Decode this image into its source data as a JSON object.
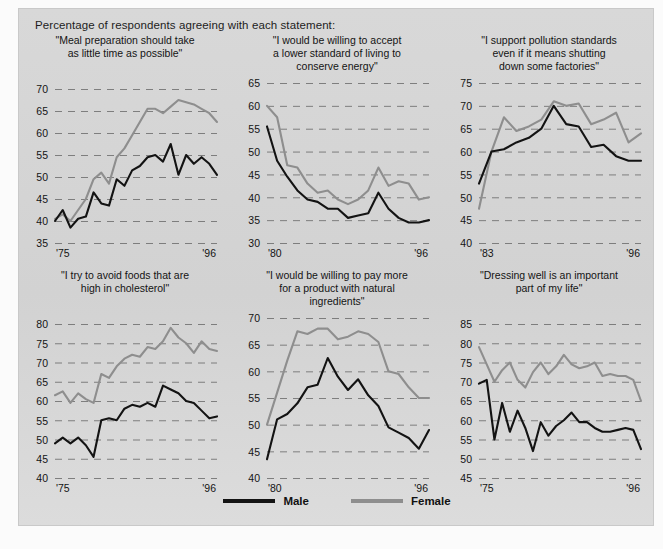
{
  "figure": {
    "header_note": "Percentage of respondents agreeing with each statement:",
    "source_note": "",
    "background_color": "#d6d6d6",
    "male_color": "#131313",
    "female_color": "#8e8e8e"
  },
  "legend": {
    "position": "bottom-center",
    "entries": [
      {
        "label": "Male",
        "color": "#131313",
        "name": "male"
      },
      {
        "label": "Female",
        "color": "#8e8e8e",
        "name": "female"
      }
    ]
  },
  "chart_data": [
    {
      "type": "line",
      "title": "\"Meal preparation should take\nas little time as possible\"",
      "xlabel": "",
      "ylabel": "",
      "ylim": [
        35,
        70
      ],
      "yticks": [
        35,
        40,
        45,
        50,
        55,
        60,
        65,
        70
      ],
      "xlim": [
        1975,
        1996
      ],
      "xticks": [
        "'75",
        "'96"
      ],
      "grid": true,
      "x": [
        1975,
        1976,
        1977,
        1978,
        1979,
        1980,
        1981,
        1982,
        1983,
        1984,
        1985,
        1986,
        1987,
        1988,
        1989,
        1990,
        1991,
        1992,
        1993,
        1994,
        1995,
        1996
      ],
      "series": [
        {
          "name": "Male",
          "color": "#131313",
          "values": [
            40.0,
            42.5,
            38.5,
            40.5,
            41.0,
            46.5,
            44.0,
            43.5,
            49.5,
            48.0,
            51.5,
            52.5,
            54.5,
            55.0,
            53.5,
            57.5,
            50.5,
            55.0,
            53.0,
            54.5,
            53.0,
            50.5
          ]
        },
        {
          "name": "Female",
          "color": "#8e8e8e",
          "values": [
            40.5,
            41.5,
            40.0,
            42.5,
            45.0,
            49.5,
            51.0,
            48.5,
            54.5,
            56.5,
            59.5,
            62.5,
            65.5,
            65.5,
            64.5,
            66.0,
            67.5,
            67.0,
            66.5,
            65.5,
            64.5,
            62.5
          ]
        }
      ]
    },
    {
      "type": "line",
      "title": "\"I would be willing to accept\na lower standard of living to\nconserve energy\"",
      "xlabel": "",
      "ylabel": "",
      "ylim": [
        30,
        65
      ],
      "yticks": [
        30,
        35,
        40,
        45,
        50,
        55,
        60,
        65
      ],
      "xlim": [
        1980,
        1996
      ],
      "xticks": [
        "'80",
        "'96"
      ],
      "grid": true,
      "x": [
        1980,
        1981,
        1982,
        1983,
        1984,
        1985,
        1986,
        1987,
        1988,
        1989,
        1990,
        1991,
        1992,
        1993,
        1994,
        1995,
        1996
      ],
      "series": [
        {
          "name": "Male",
          "color": "#131313",
          "values": [
            55.5,
            48.0,
            44.5,
            41.5,
            39.5,
            39.0,
            37.5,
            37.5,
            35.5,
            36.0,
            36.5,
            41.0,
            37.5,
            35.5,
            34.5,
            34.5,
            35.0
          ]
        },
        {
          "name": "Female",
          "color": "#8e8e8e",
          "values": [
            60.0,
            57.5,
            47.0,
            46.5,
            43.0,
            41.0,
            41.5,
            39.5,
            38.5,
            39.5,
            41.5,
            46.5,
            42.5,
            43.5,
            43.0,
            39.5,
            40.0
          ]
        }
      ]
    },
    {
      "type": "line",
      "title": "\"I support pollution standards\neven if it means shutting\ndown some factories\"",
      "xlabel": "",
      "ylabel": "",
      "ylim": [
        40,
        75
      ],
      "yticks": [
        40,
        45,
        50,
        55,
        60,
        65,
        70,
        75
      ],
      "xlim": [
        1983,
        1996
      ],
      "xticks": [
        "'83",
        "'96"
      ],
      "grid": true,
      "x": [
        1983,
        1984,
        1985,
        1986,
        1987,
        1988,
        1989,
        1990,
        1991,
        1992,
        1993,
        1994,
        1995,
        1996
      ],
      "series": [
        {
          "name": "Male",
          "color": "#131313",
          "values": [
            53.0,
            60.0,
            60.5,
            62.0,
            63.0,
            65.0,
            70.0,
            66.0,
            65.5,
            61.0,
            61.5,
            59.0,
            58.0,
            58.0
          ]
        },
        {
          "name": "Female",
          "color": "#8e8e8e",
          "values": [
            47.5,
            60.0,
            67.5,
            64.5,
            65.5,
            67.0,
            71.0,
            70.0,
            70.5,
            66.0,
            67.0,
            68.5,
            62.0,
            64.0
          ]
        }
      ]
    },
    {
      "type": "line",
      "title": "\"I try to avoid foods that are\nhigh in cholesterol\"",
      "xlabel": "",
      "ylabel": "",
      "ylim": [
        40,
        80
      ],
      "yticks": [
        40,
        45,
        50,
        55,
        60,
        65,
        70,
        75,
        80
      ],
      "xlim": [
        1975,
        1996
      ],
      "xticks": [
        "'75",
        "'96"
      ],
      "grid": true,
      "x": [
        1975,
        1976,
        1977,
        1978,
        1979,
        1980,
        1981,
        1982,
        1983,
        1984,
        1985,
        1986,
        1987,
        1988,
        1989,
        1990,
        1991,
        1992,
        1993,
        1994,
        1995,
        1996
      ],
      "series": [
        {
          "name": "Male",
          "color": "#131313",
          "values": [
            49.0,
            50.5,
            49.0,
            50.5,
            48.5,
            45.5,
            55.0,
            55.5,
            55.0,
            58.0,
            59.0,
            58.5,
            59.5,
            58.5,
            64.0,
            63.0,
            62.0,
            60.0,
            59.5,
            57.5,
            55.5,
            56.0
          ]
        },
        {
          "name": "Female",
          "color": "#8e8e8e",
          "values": [
            61.5,
            62.5,
            59.5,
            62.0,
            60.5,
            59.5,
            67.0,
            66.0,
            69.0,
            71.0,
            72.0,
            71.5,
            74.0,
            73.5,
            75.5,
            79.0,
            76.5,
            75.0,
            72.5,
            75.5,
            73.5,
            73.0
          ]
        }
      ]
    },
    {
      "type": "line",
      "title": "\"I would be willing to pay more\nfor a product with natural\ningredients\"",
      "xlabel": "",
      "ylabel": "",
      "ylim": [
        40,
        70
      ],
      "yticks": [
        40,
        45,
        50,
        55,
        60,
        65,
        70
      ],
      "xlim": [
        1980,
        1996
      ],
      "xticks": [
        "'80",
        "'96"
      ],
      "grid": true,
      "x": [
        1980,
        1981,
        1982,
        1983,
        1984,
        1985,
        1986,
        1987,
        1988,
        1989,
        1990,
        1991,
        1992,
        1993,
        1994,
        1995,
        1996
      ],
      "series": [
        {
          "name": "Male",
          "color": "#131313",
          "values": [
            43.5,
            51.0,
            52.0,
            54.0,
            57.0,
            57.5,
            62.5,
            59.0,
            56.5,
            58.5,
            55.5,
            53.5,
            49.5,
            48.5,
            47.5,
            45.5,
            49.0
          ]
        },
        {
          "name": "Female",
          "color": "#8e8e8e",
          "values": [
            50.0,
            56.0,
            62.0,
            67.5,
            67.0,
            68.0,
            68.0,
            66.0,
            66.5,
            67.5,
            67.0,
            65.5,
            60.0,
            59.5,
            57.0,
            55.0,
            55.0
          ]
        }
      ]
    },
    {
      "type": "line",
      "title": "\"Dressing well is an important\npart of my life\"",
      "xlabel": "",
      "ylabel": "",
      "ylim": [
        45,
        85
      ],
      "yticks": [
        45,
        50,
        55,
        60,
        65,
        70,
        75,
        80,
        85
      ],
      "xlim": [
        1975,
        1996
      ],
      "xticks": [
        "'75",
        "'96"
      ],
      "grid": true,
      "x": [
        1975,
        1976,
        1977,
        1978,
        1979,
        1980,
        1981,
        1982,
        1983,
        1984,
        1985,
        1986,
        1987,
        1988,
        1989,
        1990,
        1991,
        1992,
        1993,
        1994,
        1995,
        1996
      ],
      "series": [
        {
          "name": "Male",
          "color": "#131313",
          "values": [
            69.5,
            70.5,
            55.0,
            64.5,
            57.0,
            62.5,
            58.0,
            52.0,
            59.5,
            56.0,
            58.5,
            60.0,
            62.0,
            59.5,
            59.5,
            58.0,
            57.0,
            57.0,
            57.5,
            58.0,
            57.5,
            52.5
          ]
        },
        {
          "name": "Female",
          "color": "#8e8e8e",
          "values": [
            79.0,
            74.5,
            70.0,
            73.0,
            75.0,
            70.5,
            68.5,
            72.5,
            75.0,
            72.0,
            74.0,
            77.0,
            74.5,
            73.5,
            74.0,
            75.0,
            71.5,
            72.0,
            71.5,
            71.5,
            70.5,
            65.0
          ]
        }
      ]
    }
  ]
}
